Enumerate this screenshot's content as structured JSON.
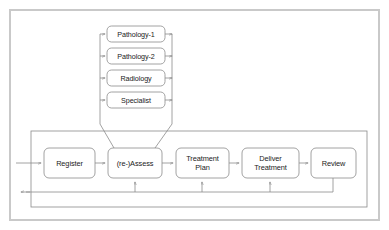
{
  "diagram": {
    "background_color": "#ffffff",
    "border_color": "#c9c9c9",
    "stroke_color": "#8a8a8a",
    "text_color": "#1b1b1b",
    "diagnostic_group": {
      "name": "diagnostic-services-stack",
      "nodes": [
        {
          "id": "pathology-1",
          "label": "Pathology-1"
        },
        {
          "id": "pathology-2",
          "label": "Pathology-2"
        },
        {
          "id": "radiology",
          "label": "Radiology"
        },
        {
          "id": "specialist",
          "label": "Specialist"
        }
      ]
    },
    "process_flow": {
      "name": "care-pathway-sequence",
      "nodes": [
        {
          "id": "register",
          "label": "Register"
        },
        {
          "id": "re-assess",
          "label": "(re-)Assess"
        },
        {
          "id": "treatment-plan",
          "label": "Treatment\nPlan"
        },
        {
          "id": "deliver-treatment",
          "label": "Deliver\nTreatment"
        },
        {
          "id": "review",
          "label": "Review"
        }
      ]
    },
    "connectors": {
      "entry_arrow": "external-input-to-register",
      "exit_arrow": "feedback-output-left",
      "feedback_targets": [
        "re-assess",
        "treatment-plan",
        "deliver-treatment"
      ],
      "funnel": "diagnostics-results-to-re-assess"
    }
  }
}
